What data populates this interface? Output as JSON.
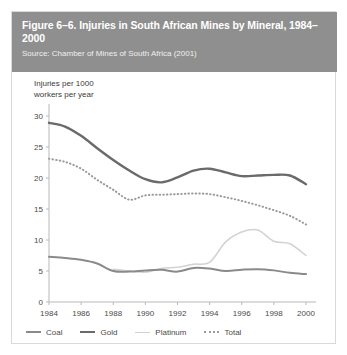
{
  "figure": {
    "title": "Figure 6–6. Injuries in South African Mines by Mineral, 1984–2000",
    "source": "Source: Chamber of Mines of South Africa (2001)",
    "header_color": "#8f8f8f",
    "panel_background": "#ffffff"
  },
  "axis": {
    "y_label_line1": "Injuries per 1000",
    "y_label_line2": "workers per year",
    "y_ticks": [
      "0",
      "5",
      "10",
      "15",
      "20",
      "25",
      "30"
    ],
    "x_ticks": [
      "1984",
      "1986",
      "1988",
      "1990",
      "1992",
      "1994",
      "1996",
      "1998",
      "2000"
    ]
  },
  "legend": {
    "items": [
      {
        "label": "Coal",
        "color": "#8a8a8a",
        "style": "solid"
      },
      {
        "label": "Gold",
        "color": "#6a6a6a",
        "style": "solid"
      },
      {
        "label": "Platinum",
        "color": "#d2d2d2",
        "style": "solid"
      },
      {
        "label": "Total",
        "color": "#9a9a9a",
        "style": "dotted"
      }
    ]
  },
  "chart_data": {
    "type": "line",
    "title": "Figure 6–6. Injuries in South African Mines by Mineral, 1984–2000",
    "xlabel": "",
    "ylabel": "Injuries per 1000 workers per year",
    "x": [
      1984,
      1985,
      1986,
      1987,
      1988,
      1989,
      1990,
      1991,
      1992,
      1993,
      1994,
      1995,
      1996,
      1997,
      1998,
      1999,
      2000
    ],
    "xlim": [
      1984,
      2000
    ],
    "ylim": [
      0,
      30
    ],
    "ytick_values": [
      0,
      5,
      10,
      15,
      20,
      25,
      30
    ],
    "xtick_values": [
      1984,
      1986,
      1988,
      1990,
      1992,
      1994,
      1996,
      1998,
      2000
    ],
    "grid": false,
    "legend_position": "below-axes",
    "series": [
      {
        "name": "Gold",
        "color": "#6a6a6a",
        "style": "solid",
        "values": [
          28.9,
          28.3,
          26.8,
          24.8,
          22.9,
          21.2,
          19.8,
          19.3,
          20.1,
          21.2,
          21.5,
          20.9,
          20.3,
          20.4,
          20.5,
          20.4,
          19.0
        ]
      },
      {
        "name": "Total",
        "color": "#9a9a9a",
        "style": "dotted",
        "values": [
          23.1,
          22.6,
          21.5,
          19.7,
          18.1,
          16.5,
          17.2,
          17.3,
          17.4,
          17.5,
          17.4,
          16.9,
          16.3,
          15.6,
          14.8,
          13.9,
          12.5
        ]
      },
      {
        "name": "Platinum",
        "color": "#d2d2d2",
        "style": "solid",
        "values": [
          null,
          null,
          null,
          null,
          5.3,
          5.0,
          4.8,
          5.4,
          5.6,
          6.1,
          6.4,
          9.7,
          11.3,
          11.6,
          9.8,
          9.4,
          7.5
        ]
      },
      {
        "name": "Coal",
        "color": "#8a8a8a",
        "style": "solid",
        "values": [
          7.3,
          7.1,
          6.8,
          6.2,
          5.0,
          4.9,
          5.1,
          5.2,
          4.9,
          5.5,
          5.4,
          5.0,
          5.2,
          5.3,
          5.1,
          4.7,
          4.5
        ]
      }
    ]
  }
}
